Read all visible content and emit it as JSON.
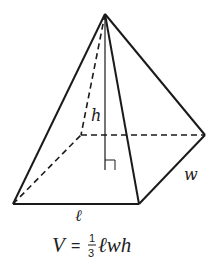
{
  "diagram": {
    "colors": {
      "stroke": "#1a1a1a",
      "background": "#ffffff"
    },
    "vertices": {
      "apex": [
        105,
        14
      ],
      "front_left": [
        13,
        204
      ],
      "front_right": [
        139,
        204
      ],
      "back_right": [
        205,
        135
      ],
      "back_left": [
        81,
        135
      ],
      "height_foot": [
        105,
        170
      ]
    },
    "labels": {
      "height": "h",
      "length": "ℓ",
      "width": "w"
    },
    "formula": {
      "lhs": "V",
      "equals": "=",
      "numerator": "1",
      "denominator": "3",
      "rhs": "ℓwh"
    }
  }
}
